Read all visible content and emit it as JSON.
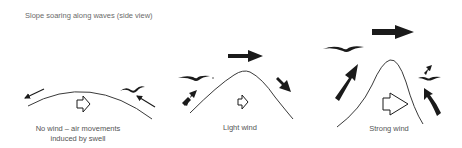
{
  "title": "Slope soaring along waves (side view)",
  "panels": [
    {
      "id": "no-wind",
      "caption_line1": "No wind – air movements",
      "caption_line2": "induced by swell"
    },
    {
      "id": "light-wind",
      "caption_line1": "Light wind"
    },
    {
      "id": "strong-wind",
      "caption_line1": "Strong wind"
    }
  ],
  "colors": {
    "ink": "#1a1a1a",
    "wave_line": "#3a3a3a",
    "text": "#555555"
  },
  "icons": {
    "bird": "bird-silhouette",
    "wind_arrow": "solid-arrow",
    "swell_direction": "hollow-arrow"
  }
}
